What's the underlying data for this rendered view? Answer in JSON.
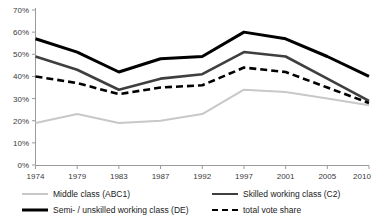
{
  "chart_data": {
    "type": "line",
    "title": "",
    "subtitle": "",
    "xlabel": "",
    "ylabel": "",
    "x": [
      1974,
      1979,
      1983,
      1987,
      1992,
      1997,
      2001,
      2005,
      2010
    ],
    "categories": [
      "1974",
      "1979",
      "1983",
      "1987",
      "1992",
      "1997",
      "2001",
      "2005",
      "2010"
    ],
    "xtick_labels": [
      "1974",
      "1979",
      "1983",
      "1987",
      "1992",
      "1997",
      "2001",
      "2005",
      "2010"
    ],
    "ytick_labels": [
      "0%",
      "10%",
      "20%",
      "30%",
      "40%",
      "50%",
      "60%",
      "70%"
    ],
    "ytick_values": [
      0,
      10,
      20,
      30,
      40,
      50,
      60,
      70
    ],
    "ylim": [
      0,
      70
    ],
    "grid": false,
    "legend_position": "bottom",
    "series": [
      {
        "name": "Middle class (ABC1)",
        "key": "middle_class",
        "color": "#c8c8c8",
        "style": "solid",
        "width": 2,
        "values": [
          19,
          23,
          19,
          20,
          23,
          34,
          33,
          30,
          27
        ]
      },
      {
        "name": "Skilled working class (C2)",
        "key": "skilled_c2",
        "color": "#3f3f3f",
        "style": "solid",
        "width": 2.6,
        "values": [
          49,
          43,
          34,
          39,
          41,
          51,
          49,
          39,
          29
        ]
      },
      {
        "name": "Semi- / unskilled working class (DE)",
        "key": "semi_unskilled_de",
        "color": "#000000",
        "style": "solid",
        "width": 3,
        "values": [
          57,
          51,
          42,
          48,
          49,
          60,
          57,
          49,
          40
        ]
      },
      {
        "name": "total vote share",
        "key": "total_vote_share",
        "color": "#000000",
        "style": "dashed",
        "width": 2.6,
        "values": [
          40,
          37,
          32,
          35,
          36,
          44,
          42,
          35,
          28
        ]
      }
    ]
  },
  "legend": {
    "items": [
      {
        "label": "Middle class (ABC1)",
        "swatch": "sw-middle"
      },
      {
        "label": "Skilled working class (C2)",
        "swatch": "sw-c2"
      },
      {
        "label": "Semi- / unskilled working class (DE)",
        "swatch": "sw-de"
      },
      {
        "label": "total vote share",
        "swatch": "sw-total"
      }
    ]
  },
  "axes": {
    "axis_color": "#9a9a9a",
    "tick_color": "#9a9a9a",
    "label_color": "#3a3a3a"
  }
}
